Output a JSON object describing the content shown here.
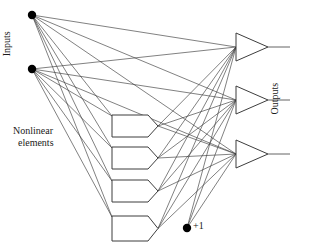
{
  "figure": {
    "background_color": "#ffffff",
    "line_color": "#3d3d3d",
    "node_color": "#000000",
    "text_color": "#1a1a1a",
    "width": 313,
    "height": 251
  },
  "labels": {
    "inputs": "Inputs",
    "outputs": "Outputs",
    "nonlinear_line1": "Nonlinear",
    "nonlinear_line2": "elements",
    "bias": "+1"
  },
  "chart_data": {
    "type": "diagram",
    "layers": [
      {
        "name": "inputs",
        "shape": "dot",
        "count": 2,
        "nodes": [
          {
            "id": "i1",
            "x": 32,
            "y": 15,
            "r": 4.2
          },
          {
            "id": "i2",
            "x": 32,
            "y": 69,
            "r": 4.2
          }
        ]
      },
      {
        "name": "nonlinear-elements",
        "shape": "pentagon",
        "count": 4,
        "nodes": [
          {
            "id": "h1",
            "x": 112,
            "y": 115,
            "w": 36,
            "h": 22
          },
          {
            "id": "h2",
            "x": 112,
            "y": 147,
            "w": 36,
            "h": 22
          },
          {
            "id": "h3",
            "x": 112,
            "y": 180,
            "w": 36,
            "h": 22
          },
          {
            "id": "h4",
            "x": 112,
            "y": 216,
            "w": 36,
            "h": 25
          }
        ]
      },
      {
        "name": "bias",
        "shape": "dot",
        "count": 1,
        "nodes": [
          {
            "id": "b1",
            "x": 187,
            "y": 228,
            "r": 4.2
          }
        ]
      },
      {
        "name": "outputs",
        "shape": "triangle",
        "count": 3,
        "nodes": [
          {
            "id": "o1",
            "x": 236,
            "y": 33,
            "w": 32,
            "h": 28,
            "lead_to_x": 290
          },
          {
            "id": "o2",
            "x": 236,
            "y": 86,
            "w": 32,
            "h": 28,
            "lead_to_x": 290
          },
          {
            "id": "o3",
            "x": 236,
            "y": 140,
            "w": 32,
            "h": 28,
            "lead_to_x": 290
          }
        ]
      }
    ],
    "edges": {
      "inputs_to_nonlinear": [
        [
          "i1",
          "h1"
        ],
        [
          "i1",
          "h2"
        ],
        [
          "i1",
          "h3"
        ],
        [
          "i1",
          "h4"
        ],
        [
          "i2",
          "h1"
        ],
        [
          "i2",
          "h2"
        ],
        [
          "i2",
          "h3"
        ],
        [
          "i2",
          "h4"
        ]
      ],
      "inputs_to_outputs": [
        [
          "i1",
          "o1"
        ],
        [
          "i1",
          "o2"
        ],
        [
          "i1",
          "o3"
        ],
        [
          "i2",
          "o1"
        ],
        [
          "i2",
          "o2"
        ],
        [
          "i2",
          "o3"
        ]
      ],
      "nonlinear_to_outputs": [
        [
          "h1",
          "o1"
        ],
        [
          "h1",
          "o2"
        ],
        [
          "h1",
          "o3"
        ],
        [
          "h2",
          "o1"
        ],
        [
          "h2",
          "o2"
        ],
        [
          "h2",
          "o3"
        ],
        [
          "h3",
          "o1"
        ],
        [
          "h3",
          "o2"
        ],
        [
          "h3",
          "o3"
        ],
        [
          "h4",
          "o1"
        ],
        [
          "h4",
          "o2"
        ],
        [
          "h4",
          "o3"
        ]
      ],
      "bias_to_outputs": [
        [
          "b1",
          "o1"
        ],
        [
          "b1",
          "o2"
        ],
        [
          "b1",
          "o3"
        ]
      ]
    },
    "annotations": [
      {
        "text": "Inputs",
        "x": 14,
        "y": 55,
        "rotation": -90
      },
      {
        "text": "Outputs",
        "x": 283,
        "y": 110,
        "rotation": -90
      },
      {
        "text": "Nonlinear elements",
        "x": 14,
        "y": 130,
        "rotation": 0
      },
      {
        "text": "+1",
        "x": 196,
        "y": 228,
        "rotation": 0
      }
    ]
  }
}
